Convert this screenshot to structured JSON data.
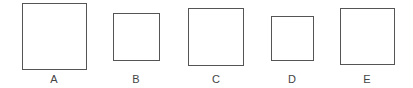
{
  "figure": {
    "items": [
      {
        "label": "A",
        "x": 22,
        "y": 3,
        "w": 65,
        "h": 67
      },
      {
        "label": "B",
        "x": 113,
        "y": 13,
        "w": 47,
        "h": 48
      },
      {
        "label": "C",
        "x": 188,
        "y": 8,
        "w": 56,
        "h": 58
      },
      {
        "label": "D",
        "x": 271,
        "y": 16,
        "w": 43,
        "h": 45
      },
      {
        "label": "E",
        "x": 340,
        "y": 8,
        "w": 55,
        "h": 57
      }
    ],
    "stroke_color": "#555555",
    "label_y": 73
  }
}
